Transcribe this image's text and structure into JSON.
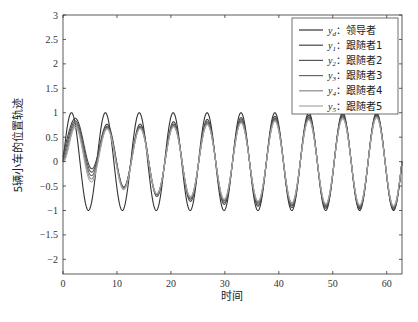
{
  "chart_data": {
    "type": "line",
    "title": "",
    "xlabel": "时间",
    "ylabel": "5辆小车的位置轨迹",
    "xlim": [
      0,
      62.83
    ],
    "ylim": [
      -2.3,
      3
    ],
    "xticks": [
      0,
      10,
      20,
      30,
      40,
      50,
      60
    ],
    "yticks": [
      -2,
      -1.5,
      -1,
      -0.5,
      0,
      0.5,
      1,
      1.5,
      2,
      2.5,
      3
    ],
    "ytick_labels": [
      "−2",
      "−1.5",
      "−1",
      "−0.5",
      "0",
      "0.5",
      "1",
      "1.5",
      "2",
      "2.5",
      "3"
    ],
    "grid": false,
    "legend_position": "upper right",
    "series": [
      {
        "name": "y_d: 领导者",
        "label_sym": "y",
        "label_sub": "d",
        "label_text": "：领导者",
        "color": "#333333",
        "function": "sin(t)",
        "amplitude": 1.0,
        "initial": 0.0
      },
      {
        "name": "y_1: 跟随者1",
        "label_sym": "y",
        "label_sub": "1",
        "label_text": "：跟随者1",
        "color": "#444444",
        "function": "converges to sin(t)",
        "amplitude_start": 0.3,
        "offset_start": 0.55,
        "initial": 0.1
      },
      {
        "name": "y_2: 跟随者2",
        "label_sym": "y",
        "label_sub": "2",
        "label_text": "：跟随者2",
        "color": "#555555",
        "function": "converges to sin(t)",
        "amplitude_start": 0.4,
        "offset_start": 0.45,
        "initial": 0.05
      },
      {
        "name": "y_3: 跟随者3",
        "label_sym": "y",
        "label_sub": "3",
        "label_text": "：跟随者3",
        "color": "#666666",
        "function": "converges to sin(t)",
        "amplitude_start": 0.5,
        "offset_start": 0.35,
        "initial": 0.0
      },
      {
        "name": "y_4: 跟随者4",
        "label_sym": "y",
        "label_sub": "4",
        "label_text": "：跟随者4",
        "color": "#8a8a8a",
        "function": "converges to sin(t)",
        "amplitude_start": 0.6,
        "offset_start": 0.25,
        "initial": 0.0
      },
      {
        "name": "y_5: 跟随者5",
        "label_sym": "y",
        "label_sub": "5",
        "label_text": "：跟随者5",
        "color": "#a5a5a5",
        "function": "converges to sin(t)",
        "amplitude_start": 0.7,
        "offset_start": 0.15,
        "initial": 0.0
      }
    ]
  }
}
